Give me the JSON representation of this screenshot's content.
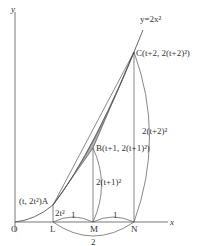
{
  "labels": {
    "y_axis": "y",
    "x_axis": "x",
    "curve": "y=2x²",
    "origin": "O",
    "point_C": "C(t+2, 2(t+2)²)",
    "point_B": "B(t+1, 2(t+1)²)",
    "point_A": "(t, 2t²)A",
    "L": "L",
    "M": "M",
    "N": "N",
    "len_AL": "2t²",
    "len_BM": "2(t+1)²",
    "len_CN": "2(t+2)²",
    "len_LM": "1",
    "len_MN": "1",
    "len_LN": "2"
  },
  "colors": {
    "shade": "#b0b0b0",
    "line": "#555555"
  }
}
